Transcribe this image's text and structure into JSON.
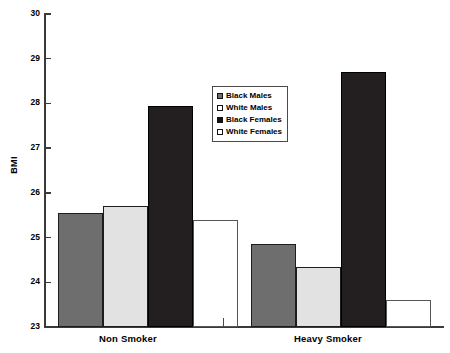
{
  "chart_data": {
    "type": "bar",
    "title": "",
    "xlabel": "",
    "ylabel": "BMI",
    "ylim": [
      23,
      30
    ],
    "yticks": [
      "23",
      "24",
      "25",
      "26",
      "27",
      "28",
      "29",
      "30"
    ],
    "grid": false,
    "legend_position": "center",
    "categories": [
      "Non Smoker",
      "Heavy Smoker"
    ],
    "series": [
      {
        "name": "Black Males",
        "swatch": "darkgray",
        "color": "#6e6e6e",
        "values": [
          25.55,
          24.85
        ]
      },
      {
        "name": "White Males",
        "swatch": "lightgray",
        "color": "#e2e2e2",
        "values": [
          25.7,
          24.35
        ]
      },
      {
        "name": "Black Females",
        "swatch": "black",
        "color": "#231f20",
        "values": [
          27.95,
          28.7
        ]
      },
      {
        "name": "White Females",
        "swatch": "white",
        "color": "#ffffff",
        "values": [
          25.4,
          23.6
        ]
      }
    ]
  },
  "axis": {
    "y_label": "BMI",
    "y_tick_labels": [
      "30",
      "29",
      "28",
      "27",
      "26",
      "25",
      "24",
      "23"
    ]
  },
  "legend": {
    "items": [
      {
        "label": "Black Males"
      },
      {
        "label": "White Males"
      },
      {
        "label": "Black Females"
      },
      {
        "label": "White Females"
      }
    ]
  },
  "x_axis": {
    "labels": [
      "Non Smoker",
      "Heavy Smoker"
    ]
  }
}
